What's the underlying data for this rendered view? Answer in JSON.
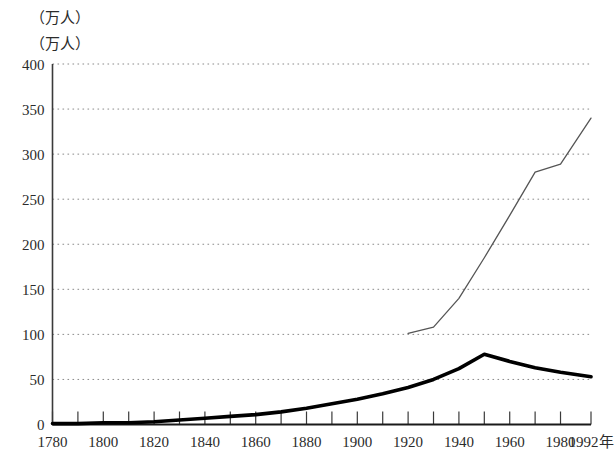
{
  "axis_unit_labels": {
    "top": "（万人）",
    "second": "（万人）"
  },
  "chart_data": {
    "type": "line",
    "title": "",
    "subtitle": "",
    "xlabel": "年",
    "ylabel": "（万人）",
    "grid": true,
    "legend": "none",
    "xlim": [
      1780,
      1992
    ],
    "ylim": [
      0,
      400
    ],
    "yticks": [
      0,
      50,
      100,
      150,
      200,
      250,
      300,
      350,
      400
    ],
    "ytick_labels": [
      "0",
      "50",
      "100",
      "150",
      "200",
      "250",
      "300",
      "350",
      "400"
    ],
    "xticks": [
      1780,
      1790,
      1800,
      1810,
      1820,
      1830,
      1840,
      1850,
      1860,
      1870,
      1880,
      1890,
      1900,
      1910,
      1920,
      1930,
      1940,
      1950,
      1960,
      1970,
      1980,
      1992
    ],
    "xtick_labels": [
      "1780",
      "1800",
      "1820",
      "1840",
      "1860",
      "1880",
      "1900",
      "1920",
      "1940",
      "1960",
      "1980",
      "1992年"
    ],
    "xtick_label_years": [
      1780,
      1800,
      1820,
      1840,
      1860,
      1880,
      1900,
      1920,
      1940,
      1960,
      1980,
      1992
    ],
    "series": [
      {
        "name": "thick-line",
        "style": "thick-black",
        "color": "#000000",
        "x": [
          1780,
          1790,
          1800,
          1810,
          1820,
          1830,
          1840,
          1850,
          1860,
          1870,
          1880,
          1890,
          1900,
          1910,
          1920,
          1930,
          1940,
          1950,
          1960,
          1970,
          1980,
          1992
        ],
        "values": [
          1,
          1,
          2,
          2,
          3,
          5,
          7,
          9,
          11,
          14,
          18,
          23,
          28,
          34,
          41,
          50,
          62,
          78,
          70,
          63,
          58,
          53
        ]
      },
      {
        "name": "thin-line",
        "style": "thin-grey",
        "color": "#555555",
        "x": [
          1920,
          1930,
          1940,
          1950,
          1960,
          1970,
          1980,
          1992
        ],
        "values": [
          101,
          108,
          140,
          185,
          232,
          280,
          289,
          340
        ]
      }
    ]
  }
}
